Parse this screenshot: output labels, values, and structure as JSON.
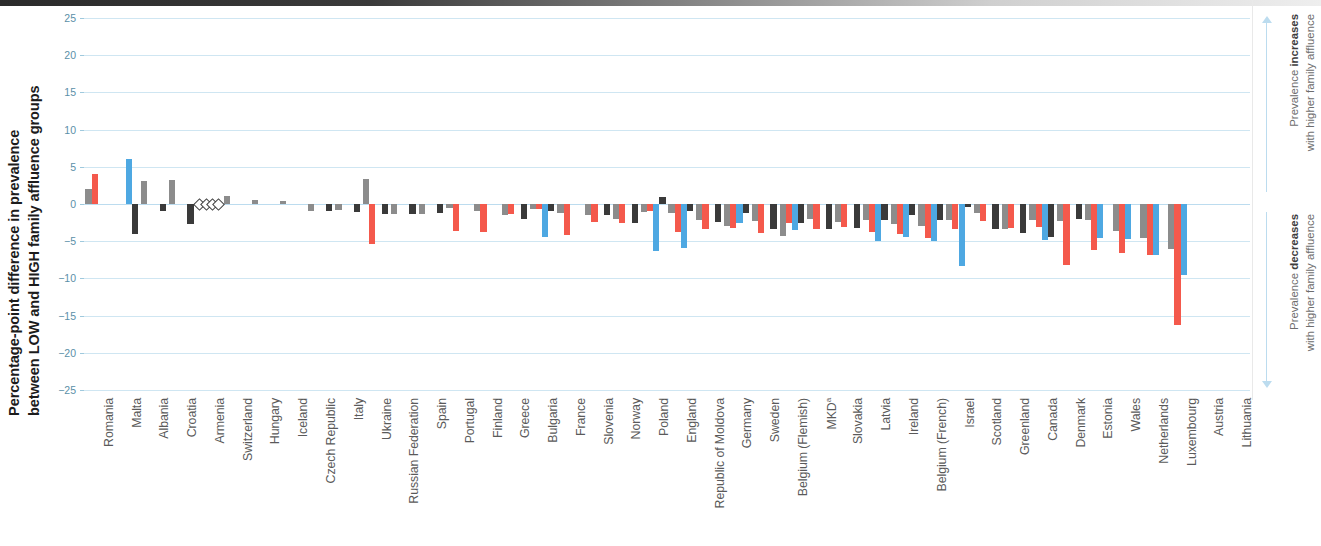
{
  "chart_data": {
    "type": "bar",
    "title": "",
    "ylabel": "Percentage-point difference in prevalence between LOW and HIGH family affluence groups",
    "xlabel": "",
    "ylim": [
      -25,
      25
    ],
    "yticks": [
      25,
      20,
      15,
      10,
      5,
      0,
      -5,
      -10,
      -15,
      -20,
      -25
    ],
    "ytick_labels": [
      "25",
      "20",
      "15",
      "10",
      "5",
      "0",
      "−5",
      "−10",
      "−15",
      "−20",
      "−25"
    ],
    "grid": true,
    "legend_position": "none",
    "series_colors": {
      "series1": "#8c8c8c",
      "series2": "#f4594c",
      "series3": "#4ea8e2",
      "series4": "#3a3a3a"
    },
    "series": [
      {
        "name": "series1",
        "color": "#8c8c8c",
        "values": [
          2.0,
          null,
          3.1,
          3.2,
          0,
          1.1,
          0.5,
          0.4,
          -0.9,
          -0.8,
          3.3,
          -1.4,
          -1.4,
          -0.5,
          -1.0,
          -1.5,
          -0.7,
          -1.2,
          -1.5,
          -2.0,
          -1.1,
          -1.2,
          -2.2,
          -2.9,
          -2.3,
          -4.3,
          -2.0,
          -2.4,
          -2.2,
          -2.7,
          -3.0,
          -2.2,
          -1.2,
          -3.4,
          -2.1,
          -2.3,
          -2.2,
          -3.6,
          -4.6,
          -6.1
        ]
      },
      {
        "name": "series2",
        "color": "#f4594c",
        "values": [
          4.0,
          null,
          null,
          null,
          0,
          null,
          null,
          null,
          null,
          null,
          -5.4,
          null,
          null,
          -3.6,
          -3.8,
          -1.3,
          -0.7,
          -4.1,
          -2.4,
          -2.6,
          -0.9,
          -3.7,
          -3.3,
          -3.2,
          -3.9,
          -2.5,
          -3.3,
          -3.1,
          -3.7,
          -4.0,
          -4.6,
          -3.3,
          -2.3,
          -3.2,
          -3.1,
          -8.2,
          -6.2,
          -6.6,
          -6.9,
          -16.2
        ]
      },
      {
        "name": "series3",
        "color": "#4ea8e2",
        "values": [
          null,
          6.0,
          null,
          null,
          0,
          null,
          null,
          null,
          null,
          null,
          null,
          null,
          null,
          null,
          null,
          null,
          -4.5,
          null,
          null,
          null,
          -6.3,
          -5.9,
          null,
          -2.5,
          null,
          -3.5,
          null,
          null,
          -5.0,
          -4.4,
          -5.0,
          -8.4,
          null,
          null,
          -4.8,
          null,
          -4.6,
          -4.7,
          -6.8,
          -9.5
        ]
      },
      {
        "name": "series4",
        "color": "#3a3a3a",
        "values": [
          null,
          -4.0,
          -1.0,
          -2.7,
          0,
          null,
          null,
          null,
          -1.0,
          -1.1,
          -1.3,
          -1.4,
          -1.2,
          null,
          null,
          -2.0,
          -1.0,
          null,
          -1.5,
          -2.6,
          0.9,
          -1.0,
          -2.4,
          -1.2,
          -3.4,
          -2.6,
          -3.4,
          -3.2,
          -2.2,
          -1.5,
          -2.2,
          -0.4,
          -3.3,
          -3.9,
          -4.5,
          -2.0,
          null,
          null,
          null,
          null
        ]
      }
    ],
    "categories": [
      "Romania",
      "Malta",
      "Albania",
      "Croatia",
      "Armenia",
      "Switzerland",
      "Hungary",
      "Iceland",
      "Czech Republic",
      "Italy",
      "Ukraine",
      "Russian Federation",
      "Spain",
      "Portugal",
      "Finland",
      "Greece",
      "Bulgaria",
      "France",
      "Slovenia",
      "Norway",
      "Poland",
      "England",
      "Republic of Moldova",
      "Germany",
      "Sweden",
      "Belgium (Flemish)",
      "MKD",
      "Slovakia",
      "Latvia",
      "Ireland",
      "Belgium (French)",
      "Israel",
      "Scotland",
      "Greenland",
      "Canada",
      "Denmark",
      "Estonia",
      "Wales",
      "Netherlands",
      "Luxembourg"
    ],
    "category_superscripts": {
      "26": "a"
    },
    "no_data_markers": {
      "description": "open diamond markers at zero indicating no data",
      "categories": [
        "Armenia",
        "Portugal",
        "Finland",
        "Bulgaria",
        "France",
        "Switzerland",
        "Hungary",
        "Iceland"
      ],
      "x_positions": [
        4,
        13,
        14,
        16,
        17
      ]
    }
  },
  "axis": {
    "y_title_line1": "Percentage-point difference in prevalence",
    "y_title_line2": "between LOW and HIGH family affluence groups"
  },
  "annotations": {
    "top_bold": "increases",
    "top_prefix": "Prevalence ",
    "top_second_line": "with higher family affluence",
    "bottom_bold": "decreases",
    "bottom_prefix": "Prevalence ",
    "bottom_second_line": "with higher family affluence"
  },
  "categories_display": [
    "Romania",
    "Malta",
    "Albania",
    "Croatia",
    "Armenia",
    "Switzerland",
    "Hungary",
    "Iceland",
    "Czech Republic",
    "Italy",
    "Ukraine",
    "Russian Federation",
    "Spain",
    "Portugal",
    "Finland",
    "Greece",
    "Bulgaria",
    "France",
    "Slovenia",
    "Norway",
    "Poland",
    "England",
    "Republic of Moldova",
    "Germany",
    "Sweden",
    "Belgium (Flemish)",
    "MKD",
    "Slovakia",
    "Latvia",
    "Ireland",
    "Belgium (French)",
    "Israel",
    "Scotland",
    "Greenland",
    "Canada",
    "Denmark",
    "Estonia",
    "Wales",
    "Netherlands",
    "Luxembourg",
    "Austria",
    "Lithuania"
  ]
}
